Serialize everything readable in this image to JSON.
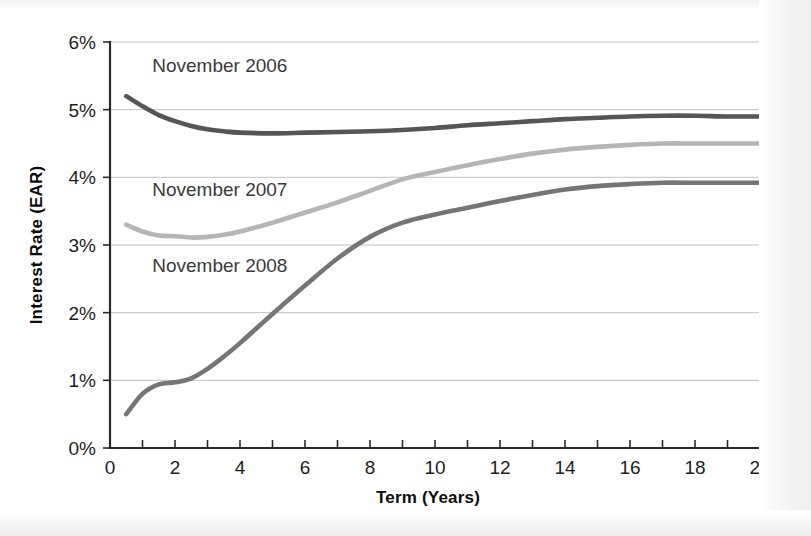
{
  "page": {
    "background_color": "#ffffff",
    "scan_edge_color": "#efefef"
  },
  "chart_data": {
    "type": "line",
    "title": "",
    "subtitle": "",
    "xlabel": "Term (Years)",
    "ylabel": "Interest Rate (EAR)",
    "xlim": [
      0,
      20
    ],
    "ylim": [
      0,
      6
    ],
    "grid": true,
    "grid_axis": "y",
    "legend": "inline-annotations",
    "x_ticks": [
      0,
      2,
      4,
      6,
      8,
      10,
      12,
      14,
      16,
      18,
      20
    ],
    "x_tick_labels": [
      "0",
      "2",
      "4",
      "6",
      "8",
      "10",
      "12",
      "14",
      "16",
      "18",
      "20"
    ],
    "x_minor_ticks": [
      1,
      3,
      5,
      7,
      9,
      11,
      13,
      15,
      17,
      19
    ],
    "y_ticks": [
      0,
      1,
      2,
      3,
      4,
      5,
      6
    ],
    "y_tick_labels": [
      "0%",
      "1%",
      "2%",
      "3%",
      "4%",
      "5%",
      "6%"
    ],
    "x": [
      0.5,
      1,
      1.5,
      2,
      2.5,
      3,
      3.5,
      4,
      5,
      6,
      7,
      8,
      9,
      10,
      11,
      12,
      13,
      14,
      15,
      16,
      17,
      18,
      19,
      20
    ],
    "series": [
      {
        "name": "November 2006",
        "color": "#555555",
        "label_text": "November 2006",
        "label_x": 1.3,
        "label_y": 5.55,
        "values": [
          5.2,
          5.05,
          4.92,
          4.83,
          4.76,
          4.71,
          4.68,
          4.66,
          4.65,
          4.66,
          4.67,
          4.68,
          4.7,
          4.73,
          4.77,
          4.8,
          4.83,
          4.86,
          4.88,
          4.9,
          4.91,
          4.91,
          4.9,
          4.9
        ]
      },
      {
        "name": "November 2007",
        "color": "#b5b5b5",
        "label_text": "November 2007",
        "label_x": 1.3,
        "label_y": 3.72,
        "values": [
          3.3,
          3.2,
          3.14,
          3.13,
          3.11,
          3.12,
          3.15,
          3.2,
          3.33,
          3.48,
          3.63,
          3.8,
          3.97,
          4.08,
          4.18,
          4.27,
          4.35,
          4.41,
          4.45,
          4.48,
          4.5,
          4.5,
          4.5,
          4.5
        ]
      },
      {
        "name": "November 2008",
        "color": "#757575",
        "label_text": "November 2008",
        "label_x": 1.3,
        "label_y": 2.6,
        "values": [
          0.5,
          0.8,
          0.94,
          0.97,
          1.03,
          1.17,
          1.35,
          1.55,
          1.98,
          2.4,
          2.8,
          3.12,
          3.33,
          3.45,
          3.55,
          3.65,
          3.74,
          3.82,
          3.87,
          3.9,
          3.92,
          3.92,
          3.92,
          3.92
        ]
      }
    ]
  }
}
